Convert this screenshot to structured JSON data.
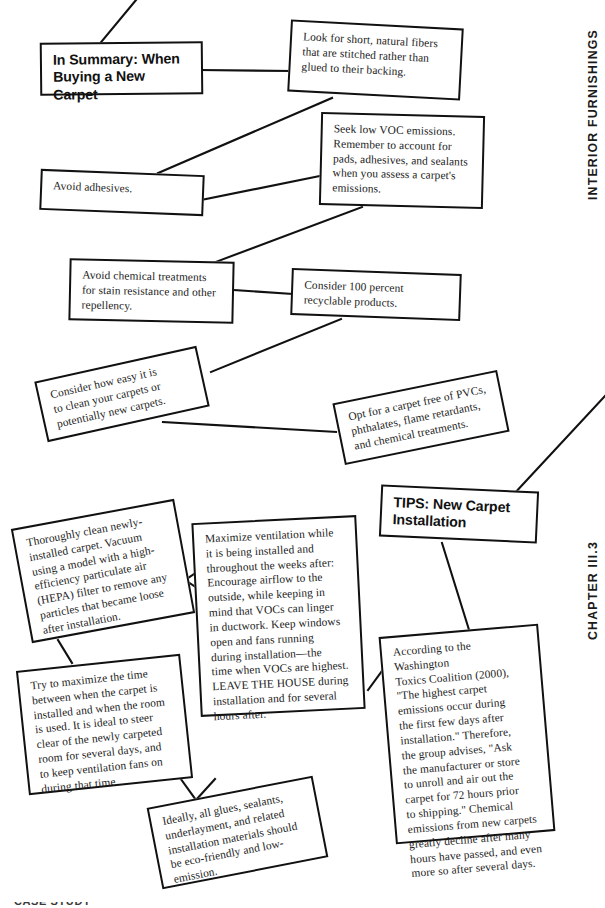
{
  "page": {
    "width": 605,
    "height": 908,
    "background": "#ffffff",
    "ink": "#111111"
  },
  "running_heads": {
    "top_right": "INTERIOR FURNISHINGS",
    "bottom_right": "CHAPTER III.3"
  },
  "footer": {
    "cutoff_text": "CASE STUDY"
  },
  "diagram_top": {
    "title": "In Summary: When\nBuying a New Carpet",
    "nodes": [
      {
        "id": "summary-title",
        "text": "In Summary: When\nBuying a New Carpet",
        "kind": "heading"
      },
      {
        "id": "short-natural-fibers",
        "text": "Look for short, natural fibers\nthat are stitched rather than\nglued to their backing.",
        "kind": "body"
      },
      {
        "id": "low-voc-emissions",
        "text": "Seek low VOC emissions.\nRemember to account for\npads, adhesives, and sealants\nwhen you assess a carpet's\nemissions.",
        "kind": "body"
      },
      {
        "id": "avoid-adhesives",
        "text": "Avoid adhesives.",
        "kind": "body"
      },
      {
        "id": "avoid-chemical-treatments",
        "text": "Avoid chemical treatments\nfor stain resistance and other\nrepellency.",
        "kind": "body"
      },
      {
        "id": "recyclable-products",
        "text": "Consider 100 percent\nrecyclable products.",
        "kind": "body"
      },
      {
        "id": "ease-of-cleaning",
        "text": "Consider how easy it is\nto clean your carpets or\npotentially new carpets.",
        "kind": "body"
      },
      {
        "id": "free-of-pvcs",
        "text": "Opt for a carpet free of PVCs,\nphthalates, flame retardants,\nand chemical treatments.",
        "kind": "body"
      }
    ]
  },
  "diagram_bottom": {
    "title": "TIPS: New Carpet\nInstallation",
    "nodes": [
      {
        "id": "tips-title",
        "text": "TIPS: New Carpet\nInstallation",
        "kind": "heading"
      },
      {
        "id": "thoroughly-clean",
        "text": "Thoroughly clean newly-\ninstalled carpet. Vacuum\nusing a model with a high-\nefficiency particulate air\n(HEPA) filter to remove any\nparticles that became loose\nafter installation.",
        "kind": "body"
      },
      {
        "id": "maximize-ventilation",
        "text": "Maximize ventilation while\nit is being installed and\nthroughout the weeks after:\nEncourage airflow to the\noutside, while keeping in\nmind that VOCs can linger\nin ductwork. Keep windows\nopen and fans running\nduring installation—the\ntime when VOCs are highest.\nLEAVE THE HOUSE during\ninstallation and for several\nhours after.",
        "kind": "body"
      },
      {
        "id": "washington-toxics-coalition",
        "text": "According to the Washington\nToxics Coalition (2000),\n\"The highest carpet\nemissions occur during\nthe first few days after\ninstallation.\" Therefore,\nthe group advises, \"Ask\nthe manufacturer or store\nto unroll and air out the\ncarpet for 72 hours prior\nto shipping.\" Chemical\nemissions from new carpets\ngreatly decline after many\nhours have passed, and even\nmore so after several days.",
        "kind": "body"
      },
      {
        "id": "maximize-time",
        "text": "Try to maximize the time\nbetween when the carpet is\ninstalled and when the room\nis used. It is ideal to steer\nclear of the newly carpeted\nroom for several days, and\nto keep ventilation fans on\nduring that time.",
        "kind": "body"
      },
      {
        "id": "eco-friendly-materials",
        "text": "Ideally, all glues, sealants,\nunderlayment, and related\ninstallation materials should\nbe eco-friendly and low-\nemission.",
        "kind": "body"
      }
    ]
  }
}
